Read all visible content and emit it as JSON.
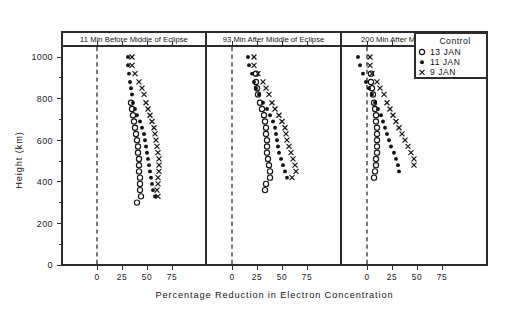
{
  "figure": {
    "xlabel": "Percentage Reduction in Electron Concentration",
    "ylabel": "Height (km)"
  },
  "legend": {
    "title": "Control",
    "entries": [
      {
        "marker": "open-circle-marker",
        "label": "13 JAN"
      },
      {
        "marker": "filled-dot-marker",
        "label": "11 JAN"
      },
      {
        "marker": "cross-marker",
        "label": "9 JAN"
      }
    ]
  },
  "chart_data": {
    "type": "scatter",
    "title": "",
    "xlabel": "Percentage Reduction in Electron Concentration",
    "ylabel": "Height (km)",
    "xlim": [
      -12,
      92
    ],
    "ylim": [
      0,
      1080
    ],
    "xticks": [
      0,
      25,
      50,
      75
    ],
    "yticks": [
      0,
      200,
      400,
      600,
      800,
      1000
    ],
    "grid": false,
    "legend_position": "top-right",
    "zero_reference_line": 0,
    "panels": [
      {
        "title": "11 Min Before Middle of Eclipse",
        "series": [
          {
            "name": "13 JAN",
            "marker": "open-circle-marker",
            "points": [
              {
                "y": 780,
                "x": 34
              },
              {
                "y": 750,
                "x": 35
              },
              {
                "y": 720,
                "x": 36
              },
              {
                "y": 690,
                "x": 37
              },
              {
                "y": 660,
                "x": 38
              },
              {
                "y": 630,
                "x": 39
              },
              {
                "y": 600,
                "x": 40
              },
              {
                "y": 570,
                "x": 41
              },
              {
                "y": 540,
                "x": 41
              },
              {
                "y": 510,
                "x": 42
              },
              {
                "y": 480,
                "x": 42
              },
              {
                "y": 450,
                "x": 42
              },
              {
                "y": 420,
                "x": 43
              },
              {
                "y": 390,
                "x": 43
              },
              {
                "y": 360,
                "x": 43
              },
              {
                "y": 330,
                "x": 44
              },
              {
                "y": 300,
                "x": 40
              }
            ]
          },
          {
            "name": "11 JAN",
            "marker": "filled-dot-marker",
            "points": [
              {
                "y": 1000,
                "x": 31
              },
              {
                "y": 960,
                "x": 31
              },
              {
                "y": 920,
                "x": 32
              },
              {
                "y": 880,
                "x": 33
              },
              {
                "y": 850,
                "x": 34
              },
              {
                "y": 820,
                "x": 35
              },
              {
                "y": 780,
                "x": 36
              },
              {
                "y": 750,
                "x": 38
              },
              {
                "y": 720,
                "x": 40
              },
              {
                "y": 690,
                "x": 43
              },
              {
                "y": 660,
                "x": 45
              },
              {
                "y": 630,
                "x": 47
              },
              {
                "y": 600,
                "x": 48
              },
              {
                "y": 570,
                "x": 49
              },
              {
                "y": 540,
                "x": 50
              },
              {
                "y": 510,
                "x": 51
              },
              {
                "y": 480,
                "x": 52
              },
              {
                "y": 450,
                "x": 53
              },
              {
                "y": 420,
                "x": 54
              },
              {
                "y": 390,
                "x": 55
              },
              {
                "y": 360,
                "x": 56
              },
              {
                "y": 330,
                "x": 58
              }
            ]
          },
          {
            "name": "9 JAN",
            "marker": "cross-marker",
            "points": [
              {
                "y": 1000,
                "x": 35
              },
              {
                "y": 960,
                "x": 35
              },
              {
                "y": 920,
                "x": 38
              },
              {
                "y": 880,
                "x": 42
              },
              {
                "y": 850,
                "x": 45
              },
              {
                "y": 820,
                "x": 47
              },
              {
                "y": 780,
                "x": 49
              },
              {
                "y": 750,
                "x": 51
              },
              {
                "y": 720,
                "x": 53
              },
              {
                "y": 690,
                "x": 55
              },
              {
                "y": 660,
                "x": 57
              },
              {
                "y": 630,
                "x": 58
              },
              {
                "y": 600,
                "x": 59
              },
              {
                "y": 570,
                "x": 60
              },
              {
                "y": 540,
                "x": 61
              },
              {
                "y": 510,
                "x": 62
              },
              {
                "y": 480,
                "x": 62
              },
              {
                "y": 450,
                "x": 62
              },
              {
                "y": 420,
                "x": 61
              },
              {
                "y": 390,
                "x": 61
              },
              {
                "y": 360,
                "x": 60
              },
              {
                "y": 330,
                "x": 61
              }
            ]
          }
        ]
      },
      {
        "title": "93 Min After  Middle of Eclipse",
        "series": [
          {
            "name": "13 JAN",
            "marker": "open-circle-marker",
            "points": [
              {
                "y": 920,
                "x": 24
              },
              {
                "y": 880,
                "x": 24
              },
              {
                "y": 850,
                "x": 25
              },
              {
                "y": 820,
                "x": 26
              },
              {
                "y": 780,
                "x": 28
              },
              {
                "y": 750,
                "x": 30
              },
              {
                "y": 720,
                "x": 32
              },
              {
                "y": 690,
                "x": 33
              },
              {
                "y": 660,
                "x": 34
              },
              {
                "y": 630,
                "x": 34
              },
              {
                "y": 600,
                "x": 35
              },
              {
                "y": 570,
                "x": 35
              },
              {
                "y": 540,
                "x": 35
              },
              {
                "y": 510,
                "x": 36
              },
              {
                "y": 480,
                "x": 37
              },
              {
                "y": 450,
                "x": 38
              },
              {
                "y": 420,
                "x": 38
              },
              {
                "y": 390,
                "x": 34
              },
              {
                "y": 360,
                "x": 33
              }
            ]
          },
          {
            "name": "11 JAN",
            "marker": "filled-dot-marker",
            "points": [
              {
                "y": 1000,
                "x": 16
              },
              {
                "y": 960,
                "x": 17
              },
              {
                "y": 920,
                "x": 20
              },
              {
                "y": 880,
                "x": 22
              },
              {
                "y": 850,
                "x": 24
              },
              {
                "y": 820,
                "x": 27
              },
              {
                "y": 780,
                "x": 31
              },
              {
                "y": 750,
                "x": 35
              },
              {
                "y": 720,
                "x": 38
              },
              {
                "y": 690,
                "x": 41
              },
              {
                "y": 660,
                "x": 43
              },
              {
                "y": 630,
                "x": 44
              },
              {
                "y": 600,
                "x": 45
              },
              {
                "y": 570,
                "x": 46
              },
              {
                "y": 540,
                "x": 47
              },
              {
                "y": 510,
                "x": 49
              },
              {
                "y": 480,
                "x": 51
              },
              {
                "y": 450,
                "x": 53
              },
              {
                "y": 420,
                "x": 55
              }
            ]
          },
          {
            "name": "9 JAN",
            "marker": "cross-marker",
            "points": [
              {
                "y": 1000,
                "x": 22
              },
              {
                "y": 960,
                "x": 22
              },
              {
                "y": 920,
                "x": 26
              },
              {
                "y": 880,
                "x": 31
              },
              {
                "y": 850,
                "x": 34
              },
              {
                "y": 820,
                "x": 37
              },
              {
                "y": 780,
                "x": 40
              },
              {
                "y": 750,
                "x": 43
              },
              {
                "y": 720,
                "x": 47
              },
              {
                "y": 690,
                "x": 50
              },
              {
                "y": 660,
                "x": 53
              },
              {
                "y": 630,
                "x": 54
              },
              {
                "y": 600,
                "x": 55
              },
              {
                "y": 570,
                "x": 57
              },
              {
                "y": 540,
                "x": 59
              },
              {
                "y": 510,
                "x": 61
              },
              {
                "y": 480,
                "x": 63
              },
              {
                "y": 450,
                "x": 64
              },
              {
                "y": 420,
                "x": 60
              }
            ]
          }
        ]
      },
      {
        "title": "200 Min After Middle of Eclipse",
        "series": [
          {
            "name": "13 JAN",
            "marker": "open-circle-marker",
            "points": [
              {
                "y": 920,
                "x": 4
              },
              {
                "y": 880,
                "x": 4
              },
              {
                "y": 850,
                "x": 5
              },
              {
                "y": 820,
                "x": 6
              },
              {
                "y": 780,
                "x": 7
              },
              {
                "y": 750,
                "x": 8
              },
              {
                "y": 720,
                "x": 9
              },
              {
                "y": 690,
                "x": 9
              },
              {
                "y": 660,
                "x": 10
              },
              {
                "y": 630,
                "x": 10
              },
              {
                "y": 600,
                "x": 10
              },
              {
                "y": 570,
                "x": 10
              },
              {
                "y": 540,
                "x": 10
              },
              {
                "y": 510,
                "x": 9
              },
              {
                "y": 480,
                "x": 9
              },
              {
                "y": 450,
                "x": 8
              },
              {
                "y": 420,
                "x": 7
              }
            ]
          },
          {
            "name": "11 JAN",
            "marker": "filled-dot-marker",
            "points": [
              {
                "y": 1000,
                "x": -9
              },
              {
                "y": 960,
                "x": -7
              },
              {
                "y": 920,
                "x": -4
              },
              {
                "y": 880,
                "x": -1
              },
              {
                "y": 850,
                "x": 2
              },
              {
                "y": 820,
                "x": 5
              },
              {
                "y": 780,
                "x": 8
              },
              {
                "y": 750,
                "x": 11
              },
              {
                "y": 720,
                "x": 14
              },
              {
                "y": 690,
                "x": 16
              },
              {
                "y": 660,
                "x": 18
              },
              {
                "y": 630,
                "x": 20
              },
              {
                "y": 600,
                "x": 22
              },
              {
                "y": 570,
                "x": 24
              },
              {
                "y": 540,
                "x": 27
              },
              {
                "y": 510,
                "x": 29
              },
              {
                "y": 480,
                "x": 31
              },
              {
                "y": 450,
                "x": 32
              }
            ]
          },
          {
            "name": "9 JAN",
            "marker": "cross-marker",
            "points": [
              {
                "y": 1000,
                "x": 3
              },
              {
                "y": 960,
                "x": 3
              },
              {
                "y": 920,
                "x": 5
              },
              {
                "y": 880,
                "x": 10
              },
              {
                "y": 850,
                "x": 13
              },
              {
                "y": 820,
                "x": 17
              },
              {
                "y": 780,
                "x": 20
              },
              {
                "y": 750,
                "x": 23
              },
              {
                "y": 720,
                "x": 26
              },
              {
                "y": 690,
                "x": 29
              },
              {
                "y": 660,
                "x": 32
              },
              {
                "y": 630,
                "x": 35
              },
              {
                "y": 600,
                "x": 38
              },
              {
                "y": 570,
                "x": 41
              },
              {
                "y": 540,
                "x": 44
              },
              {
                "y": 510,
                "x": 47
              },
              {
                "y": 480,
                "x": 47
              }
            ]
          }
        ]
      }
    ]
  }
}
